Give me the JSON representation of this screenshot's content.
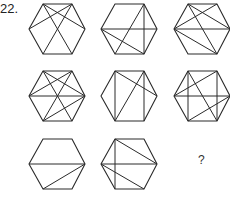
{
  "question": {
    "number_label": "22.",
    "answer_placeholder": "?"
  },
  "vertex_legend": {
    "A": "top-left",
    "B": "top-right",
    "C": "right",
    "D": "bottom-right",
    "E": "bottom-left",
    "F": "left"
  },
  "figures": [
    {
      "row": 1,
      "col": 1,
      "origin": [
        29,
        4
      ],
      "lines": [
        [
          "A",
          "C"
        ],
        [
          "B",
          "F"
        ],
        [
          "A",
          "D"
        ],
        [
          "B",
          "E"
        ]
      ]
    },
    {
      "row": 1,
      "col": 2,
      "origin": [
        101,
        4
      ],
      "lines": [
        [
          "F",
          "C"
        ],
        [
          "B",
          "E"
        ],
        [
          "B",
          "D"
        ],
        [
          "F",
          "D"
        ]
      ]
    },
    {
      "row": 1,
      "col": 3,
      "origin": [
        174,
        4
      ],
      "lines": [
        [
          "A",
          "C"
        ],
        [
          "B",
          "F"
        ],
        [
          "F",
          "C"
        ],
        [
          "A",
          "D"
        ],
        [
          "F",
          "D"
        ]
      ]
    },
    {
      "row": 2,
      "col": 1,
      "origin": [
        29,
        71
      ],
      "lines": [
        [
          "A",
          "C"
        ],
        [
          "B",
          "F"
        ],
        [
          "A",
          "D"
        ],
        [
          "B",
          "E"
        ],
        [
          "F",
          "C"
        ],
        [
          "E",
          "C"
        ]
      ]
    },
    {
      "row": 2,
      "col": 2,
      "origin": [
        101,
        71
      ],
      "lines": [
        [
          "A",
          "E"
        ],
        [
          "B",
          "D"
        ],
        [
          "A",
          "C"
        ],
        [
          "B",
          "E"
        ]
      ]
    },
    {
      "row": 2,
      "col": 3,
      "origin": [
        174,
        71
      ],
      "lines": [
        [
          "A",
          "E"
        ],
        [
          "B",
          "D"
        ],
        [
          "F",
          "C"
        ],
        [
          "F",
          "B"
        ],
        [
          "A",
          "D"
        ],
        [
          "E",
          "C"
        ]
      ]
    },
    {
      "row": 3,
      "col": 1,
      "origin": [
        29,
        139
      ],
      "lines": [
        [
          "F",
          "C"
        ],
        [
          "E",
          "C"
        ]
      ]
    },
    {
      "row": 3,
      "col": 2,
      "origin": [
        101,
        139
      ],
      "lines": [
        [
          "A",
          "E"
        ],
        [
          "A",
          "C"
        ],
        [
          "F",
          "C"
        ],
        [
          "F",
          "D"
        ]
      ]
    },
    {
      "row": 3,
      "col": 3,
      "missing": true
    }
  ]
}
